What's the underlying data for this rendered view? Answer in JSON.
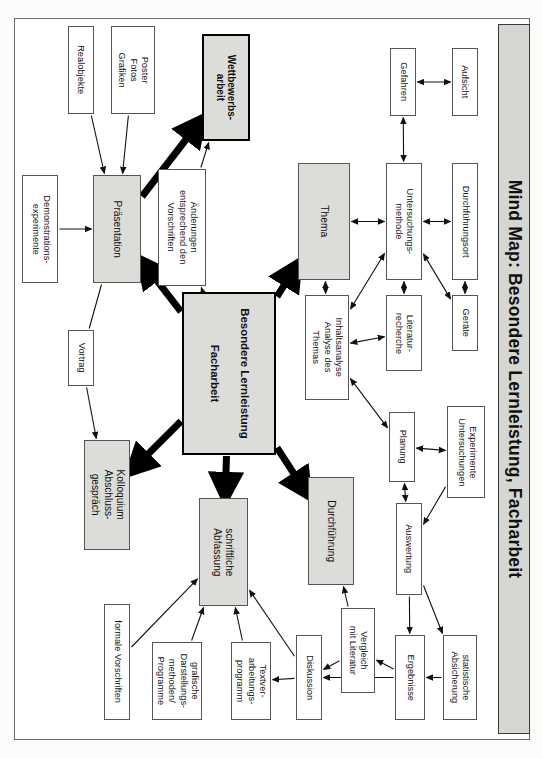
{
  "title": "Mind Map: Besondere Lernleistung, Facharbeit",
  "colors": {
    "gray_fill": "#dcdcd8",
    "border": "#555555",
    "heavy_border": "#000000",
    "page": "#ffffff",
    "title_band": "#d6d6d2"
  },
  "chart_data": {
    "type": "diagram",
    "title": "Mind Map: Besondere Lernleistung, Facharbeit",
    "orientation": "rotated-90-landscape-page",
    "nodes": [
      {
        "id": "realobjekte",
        "label": "Realobjekte",
        "style": "plain",
        "x": 68,
        "y": 26,
        "w": 26,
        "h": 88
      },
      {
        "id": "poster",
        "label": "Poster\nFotos\nGrafiken",
        "style": "plain",
        "x": 111,
        "y": 26,
        "w": 44,
        "h": 88
      },
      {
        "id": "wettbewerb",
        "label": "Wettbewerbs-\narbeit",
        "style": "heavy-gray",
        "x": 202,
        "y": 34,
        "w": 48,
        "h": 107
      },
      {
        "id": "demoexp",
        "label": "Demonstrations-\nexperimente",
        "style": "plain",
        "x": 22,
        "y": 175,
        "w": 36,
        "h": 108
      },
      {
        "id": "praesentation",
        "label": "Präsentation",
        "style": "gray",
        "x": 93,
        "y": 175,
        "w": 48,
        "h": 108
      },
      {
        "id": "aenderungen",
        "label": "Änderungen\nentsprechend den\nVorschriften",
        "style": "plain",
        "x": 158,
        "y": 169,
        "w": 48,
        "h": 117
      },
      {
        "id": "thema",
        "label": "Thema",
        "style": "gray",
        "x": 298,
        "y": 163,
        "w": 52,
        "h": 117
      },
      {
        "id": "untersuchung",
        "label": "Untersuchungs-\nmethode",
        "style": "plain",
        "x": 386,
        "y": 163,
        "w": 36,
        "h": 117
      },
      {
        "id": "gefahren",
        "label": "Gefahren",
        "style": "plain",
        "x": 390,
        "y": 48,
        "w": 26,
        "h": 68
      },
      {
        "id": "aufsicht",
        "label": "Aufsicht",
        "style": "plain",
        "x": 452,
        "y": 48,
        "w": 26,
        "h": 68
      },
      {
        "id": "durchfort",
        "label": "Durchführungsort",
        "style": "plain",
        "x": 452,
        "y": 163,
        "w": 26,
        "h": 117
      },
      {
        "id": "geraete",
        "label": "Geräte",
        "style": "plain",
        "x": 452,
        "y": 295,
        "w": 26,
        "h": 56
      },
      {
        "id": "literatur",
        "label": "Literatur-\nrecherche",
        "style": "plain",
        "x": 386,
        "y": 295,
        "w": 36,
        "h": 76
      },
      {
        "id": "inhaltsanalyse",
        "label": "Inhaltsanalyse\nAnalyse des\nThemas",
        "style": "plain",
        "x": 305,
        "y": 295,
        "w": 44,
        "h": 105
      },
      {
        "id": "besondere",
        "label": "Besondere Lernleistung\n\nFacharbeit",
        "style": "center",
        "x": 182,
        "y": 292,
        "w": 94,
        "h": 163
      },
      {
        "id": "vortrag",
        "label": "Vortrag",
        "style": "plain",
        "x": 68,
        "y": 330,
        "w": 26,
        "h": 56
      },
      {
        "id": "kolloquium",
        "label": "Kolloquium\nAbschluss-\ngespräch",
        "style": "gray",
        "x": 84,
        "y": 440,
        "w": 46,
        "h": 110
      },
      {
        "id": "abfassung",
        "label": "schriftliche\nAbfassung",
        "style": "gray",
        "x": 199,
        "y": 498,
        "w": 49,
        "h": 108
      },
      {
        "id": "durchfuehrung",
        "label": "Durchführung",
        "style": "gray",
        "x": 308,
        "y": 477,
        "w": 46,
        "h": 108
      },
      {
        "id": "planung",
        "label": "Planung",
        "style": "plain",
        "x": 389,
        "y": 412,
        "w": 26,
        "h": 70
      },
      {
        "id": "experimente",
        "label": "Experimente\nUntersuchungen",
        "style": "plain",
        "x": 447,
        "y": 406,
        "w": 38,
        "h": 92
      },
      {
        "id": "auswertung",
        "label": "Auswertung",
        "style": "plain",
        "x": 396,
        "y": 503,
        "w": 26,
        "h": 92
      },
      {
        "id": "formale",
        "label": "formale Vorschriften",
        "style": "plain",
        "x": 104,
        "y": 604,
        "w": 26,
        "h": 116
      },
      {
        "id": "grafische",
        "label": "grafische\nDarstellungs-\nmethoden/\nProgramme",
        "style": "plain",
        "x": 152,
        "y": 642,
        "w": 50,
        "h": 78
      },
      {
        "id": "textver",
        "label": "Textver-\narbeitungs-\nprogramm",
        "style": "plain",
        "x": 231,
        "y": 642,
        "w": 40,
        "h": 78
      },
      {
        "id": "diskussion",
        "label": "Diskussion",
        "style": "plain",
        "x": 296,
        "y": 635,
        "w": 26,
        "h": 85
      },
      {
        "id": "vergleich",
        "label": "Vergleich\nmit Literatur",
        "style": "plain",
        "x": 341,
        "y": 608,
        "w": 34,
        "h": 85
      },
      {
        "id": "ergebnisse",
        "label": "Ergebnisse",
        "style": "plain",
        "x": 395,
        "y": 635,
        "w": 30,
        "h": 85
      },
      {
        "id": "statistische",
        "label": "statistische\nAbsicherung",
        "style": "plain",
        "x": 443,
        "y": 635,
        "w": 34,
        "h": 85
      }
    ],
    "edges": [
      {
        "from": "realobjekte",
        "to": "praesentation",
        "kind": "thin",
        "arrow": "single"
      },
      {
        "from": "poster",
        "to": "praesentation",
        "kind": "thin",
        "arrow": "single"
      },
      {
        "from": "demoexp",
        "to": "praesentation",
        "kind": "thin",
        "arrow": "single"
      },
      {
        "from": "praesentation",
        "to": "wettbewerb",
        "kind": "thick",
        "arrow": "single"
      },
      {
        "from": "aenderungen",
        "to": "wettbewerb",
        "kind": "thin",
        "arrow": "single"
      },
      {
        "from": "besondere",
        "to": "aenderungen",
        "kind": "thin",
        "arrow": "single"
      },
      {
        "from": "besondere",
        "to": "praesentation",
        "kind": "thick",
        "arrow": "single"
      },
      {
        "from": "besondere",
        "to": "thema",
        "kind": "thick",
        "arrow": "single"
      },
      {
        "from": "besondere",
        "to": "kolloquium",
        "kind": "thick",
        "arrow": "single"
      },
      {
        "from": "besondere",
        "to": "abfassung",
        "kind": "thick",
        "arrow": "single"
      },
      {
        "from": "besondere",
        "to": "durchfuehrung",
        "kind": "thick",
        "arrow": "single"
      },
      {
        "from": "vortrag",
        "to": "kolloquium",
        "kind": "thin",
        "arrow": "single"
      },
      {
        "from": "praesentation",
        "to": "vortrag",
        "kind": "thin",
        "arrow": "none"
      },
      {
        "from": "thema",
        "to": "untersuchung",
        "kind": "thin",
        "arrow": "double"
      },
      {
        "from": "thema",
        "to": "inhaltsanalyse",
        "kind": "thin",
        "arrow": "double"
      },
      {
        "from": "gefahren",
        "to": "aufsicht",
        "kind": "thin",
        "arrow": "double"
      },
      {
        "from": "gefahren",
        "to": "untersuchung",
        "kind": "thin",
        "arrow": "double"
      },
      {
        "from": "untersuchung",
        "to": "durchfort",
        "kind": "thin",
        "arrow": "double"
      },
      {
        "from": "untersuchung",
        "to": "literatur",
        "kind": "thin",
        "arrow": "double"
      },
      {
        "from": "untersuchung",
        "to": "geraete",
        "kind": "thin",
        "arrow": "double"
      },
      {
        "from": "untersuchung",
        "to": "inhaltsanalyse",
        "kind": "thin",
        "arrow": "double"
      },
      {
        "from": "durchfort",
        "to": "geraete",
        "kind": "thin",
        "arrow": "double"
      },
      {
        "from": "inhaltsanalyse",
        "to": "literatur",
        "kind": "thin",
        "arrow": "double"
      },
      {
        "from": "inhaltsanalyse",
        "to": "planung",
        "kind": "thin",
        "arrow": "double"
      },
      {
        "from": "planung",
        "to": "experimente",
        "kind": "thin",
        "arrow": "double"
      },
      {
        "from": "planung",
        "to": "auswertung",
        "kind": "thin",
        "arrow": "double"
      },
      {
        "from": "experimente",
        "to": "auswertung",
        "kind": "thin",
        "arrow": "single"
      },
      {
        "from": "auswertung",
        "to": "ergebnisse",
        "kind": "thin",
        "arrow": "single"
      },
      {
        "from": "auswertung",
        "to": "statistische",
        "kind": "thin",
        "arrow": "single"
      },
      {
        "from": "statistische",
        "to": "ergebnisse",
        "kind": "thin",
        "arrow": "single"
      },
      {
        "from": "ergebnisse",
        "to": "vergleich",
        "kind": "thin",
        "arrow": "single"
      },
      {
        "from": "ergebnisse",
        "to": "diskussion",
        "kind": "thin",
        "arrow": "single"
      },
      {
        "from": "vergleich",
        "to": "diskussion",
        "kind": "thin",
        "arrow": "single"
      },
      {
        "from": "vergleich",
        "to": "durchfuehrung",
        "kind": "thin",
        "arrow": "single"
      },
      {
        "from": "diskussion",
        "to": "textver",
        "kind": "thin",
        "arrow": "single"
      },
      {
        "from": "diskussion",
        "to": "abfassung",
        "kind": "thin",
        "arrow": "single"
      },
      {
        "from": "formale",
        "to": "abfassung",
        "kind": "thin",
        "arrow": "single"
      },
      {
        "from": "grafische",
        "to": "abfassung",
        "kind": "thin",
        "arrow": "single"
      },
      {
        "from": "textver",
        "to": "abfassung",
        "kind": "thin",
        "arrow": "single"
      }
    ]
  }
}
